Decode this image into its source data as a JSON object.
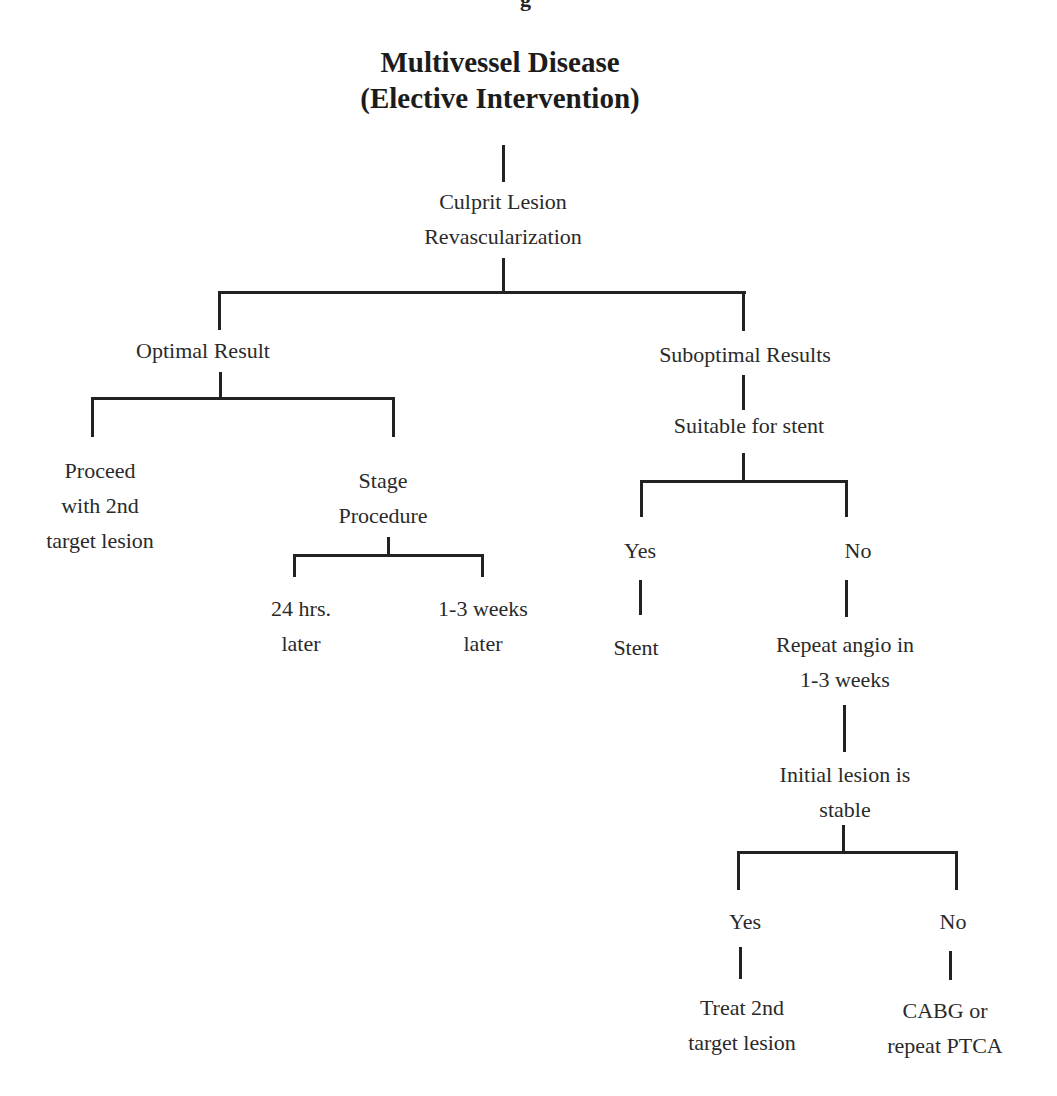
{
  "title": {
    "line1": "Multivessel Disease",
    "line2": "(Elective Intervention)"
  },
  "nodes": {
    "culprit": {
      "line1": "Culprit Lesion",
      "line2": "Revascularization"
    },
    "optimal": {
      "line1": "Optimal Result"
    },
    "proceed": {
      "line1": "Proceed",
      "line2": "with 2nd",
      "line3": "target lesion"
    },
    "stage": {
      "line1": "Stage",
      "line2": "Procedure"
    },
    "hrs24": {
      "line1": "24 hrs.",
      "line2": "later"
    },
    "weeks13": {
      "line1": "1-3 weeks",
      "line2": "later"
    },
    "suboptimal": {
      "line1": "Suboptimal Results"
    },
    "suitable": {
      "line1": "Suitable for stent"
    },
    "yes1": {
      "line1": "Yes"
    },
    "no1": {
      "line1": "No"
    },
    "stent": {
      "line1": "Stent"
    },
    "repeat": {
      "line1": "Repeat angio in",
      "line2": "1-3 weeks"
    },
    "initial": {
      "line1": "Initial lesion is",
      "line2": "stable"
    },
    "yes2": {
      "line1": "Yes"
    },
    "no2": {
      "line1": "No"
    },
    "treat": {
      "line1": "Treat 2nd",
      "line2": "target lesion"
    },
    "cabg": {
      "line1": "CABG or",
      "line2": "repeat PTCA"
    }
  },
  "colors": {
    "line": "#222222",
    "text": "#2a2a2a",
    "background": "#ffffff"
  }
}
